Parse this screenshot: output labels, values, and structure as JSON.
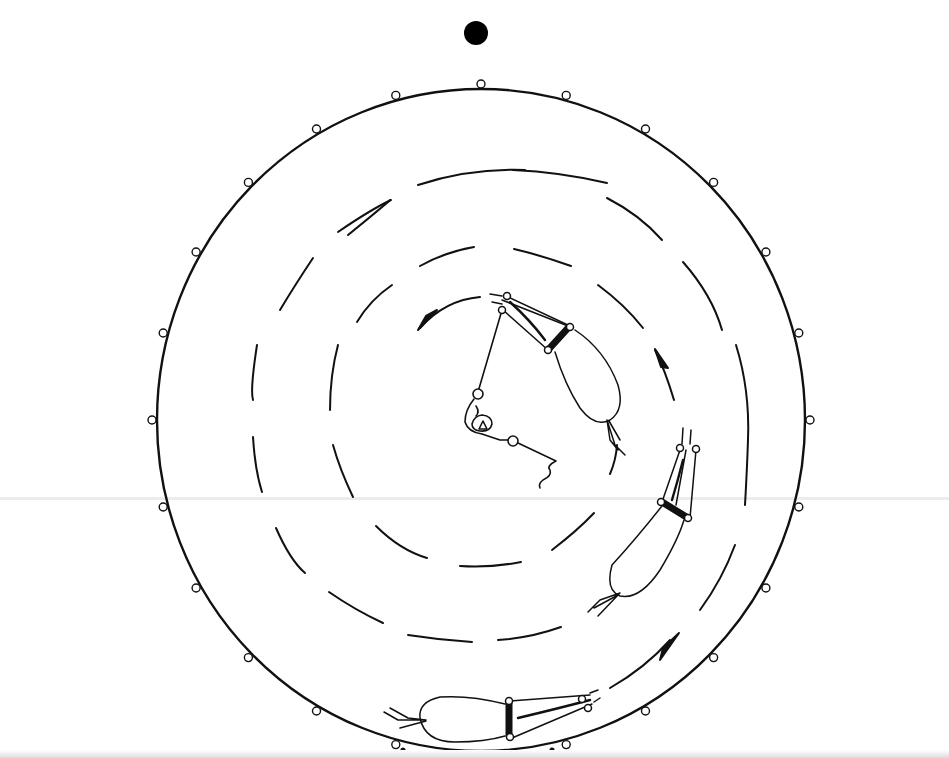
{
  "figure": {
    "type": "technical line drawing",
    "colors": {
      "ink": "#111111",
      "background": "#ffffff",
      "scan_line": "#ececec"
    },
    "center": {
      "x": 481,
      "y": 420
    },
    "top_marker": {
      "shape": "filled-circle",
      "x": 476,
      "y": 33,
      "r": 12
    },
    "outer_track": {
      "rx": 325,
      "ry": 332,
      "loop_count": 24,
      "loop_radius": 4
    },
    "dashed_rings": [
      {
        "name": "outer-dashed-ring",
        "r": 250,
        "segments": 14
      },
      {
        "name": "inner-dashed-ring",
        "r": 175,
        "segments": 12
      }
    ],
    "arrows": [
      {
        "name": "arrow-top-left",
        "direction": "counter-clockwise"
      },
      {
        "name": "arrow-right",
        "direction": "clockwise"
      },
      {
        "name": "arrow-bottom-right",
        "direction": "clockwise"
      }
    ],
    "devices": [
      {
        "name": "bag-device-top",
        "angle_deg": -40
      },
      {
        "name": "bag-device-right",
        "angle_deg": 25
      },
      {
        "name": "bag-device-bottom",
        "angle_deg": 95
      }
    ],
    "labels": []
  }
}
